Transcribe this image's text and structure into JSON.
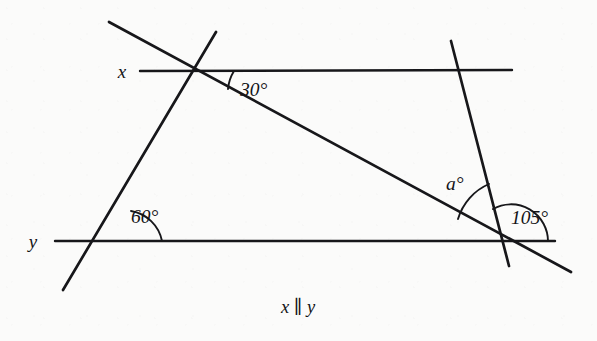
{
  "figure": {
    "type": "geometry-diagram",
    "background_color": "#fbfbfa",
    "ink_color": "#17171a"
  },
  "labels": {
    "line_x": "x",
    "line_y": "y",
    "angle_top": "30°",
    "angle_lower_left": "60°",
    "angle_unknown": "a°",
    "angle_lower_right": "105°"
  },
  "caption": {
    "text": "x ∥ y"
  },
  "geometry": {
    "lines": [
      {
        "name": "line-x",
        "role": "parallel-line-upper",
        "x1": 140,
        "y1": 71,
        "x2": 512,
        "y2": 70,
        "stroke_width": 2.4
      },
      {
        "name": "line-y",
        "role": "parallel-line-lower",
        "x1": 55,
        "y1": 241,
        "x2": 555,
        "y2": 241,
        "stroke_width": 2.4
      },
      {
        "name": "left-transversal",
        "role": "transversal",
        "x1": 216,
        "y1": 32,
        "x2": 63,
        "y2": 290,
        "stroke_width": 2.7
      },
      {
        "name": "long-diagonal",
        "role": "transversal",
        "x1": 109,
        "y1": 22,
        "x2": 571,
        "y2": 272,
        "stroke_width": 2.7
      },
      {
        "name": "right-transversal",
        "role": "transversal",
        "x1": 451,
        "y1": 41,
        "x2": 509,
        "y2": 266,
        "stroke_width": 2.7
      }
    ],
    "vertices": [
      {
        "name": "top-vertex",
        "x": 193,
        "y": 71
      },
      {
        "name": "bottom-left-vertex",
        "x": 124,
        "y": 241
      },
      {
        "name": "bottom-right-vertex",
        "x": 511,
        "y": 242
      },
      {
        "name": "right-x-crossing",
        "x": 462,
        "y": 70
      }
    ],
    "arcs": [
      {
        "name": "arc-30",
        "d": "M 232 71 A 39 39 0 0 0 227 88"
      },
      {
        "name": "arc-60",
        "d": "M 129 213 A 36 36 0 0 0 160 241"
      },
      {
        "name": "arc-a",
        "d": "M 457 182 A 50 50 0 0 0 476 219"
      },
      {
        "name": "arc-105",
        "d": "M 489 208 A 36 36 0 0 1 546 241"
      }
    ]
  },
  "label_positions": {
    "line_x": {
      "x": 122,
      "y": 78
    },
    "line_y": {
      "x": 33,
      "y": 248
    },
    "angle_top": {
      "x": 240,
      "y": 96
    },
    "angle_lower_left": {
      "x": 131,
      "y": 223
    },
    "angle_unknown": {
      "x": 446,
      "y": 190
    },
    "angle_lower_right": {
      "x": 511,
      "y": 224
    },
    "caption": {
      "x": 298,
      "y": 313
    }
  }
}
